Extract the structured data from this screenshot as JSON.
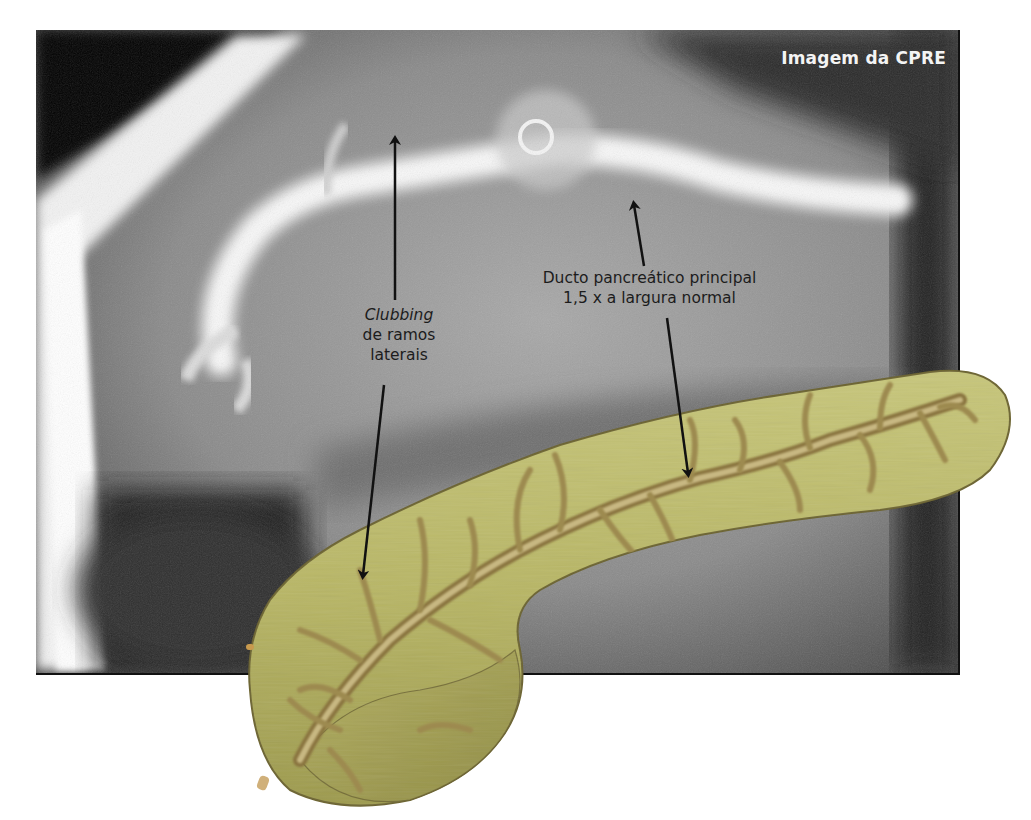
{
  "figure": {
    "xray": {
      "title": "Imagem da CPRE"
    },
    "annotations": [
      {
        "id": "clubbing",
        "line1_italic": "Clubbing",
        "line2": "de ramos",
        "line3": "laterais",
        "arrows": [
          {
            "from": [
              395,
              300
            ],
            "to": [
              395,
              137
            ]
          },
          {
            "from": [
              384,
              385
            ],
            "to": [
              362,
              578
            ]
          }
        ]
      },
      {
        "id": "main-duct",
        "line1": "Ducto pancreático principal",
        "line2": "1,5 x a largura normal",
        "arrows": [
          {
            "from": [
              644,
              266
            ],
            "to": [
              634,
              202
            ]
          },
          {
            "from": [
              667,
              318
            ],
            "to": [
              688,
              476
            ]
          }
        ]
      }
    ],
    "illustration": {
      "subject": "pancreas",
      "colors": {
        "parenchyma": "#b9b866",
        "parenchyma_dark": "#8f8a45",
        "duct": "#a08a52",
        "duct_highlight": "#d2c69a",
        "outline": "#6d6533"
      }
    }
  }
}
